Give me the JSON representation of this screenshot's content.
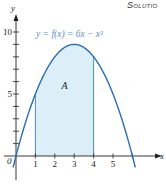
{
  "header": {
    "section_label": "Solutio"
  },
  "chart_data": {
    "type": "area",
    "title": "",
    "function_label": "y = f(x) = 6x − x²",
    "equation": "y = 6x - x^2",
    "xlabel": "x",
    "ylabel": "y",
    "region_label": "A",
    "shaded_interval": [
      1,
      4
    ],
    "xlim": [
      -0.3,
      7.2
    ],
    "ylim": [
      -1.5,
      11.5
    ],
    "x_ticks": [
      1,
      2,
      3,
      4,
      5
    ],
    "x_tick_labels": [
      "1",
      "2",
      "3",
      "4",
      "5"
    ],
    "y_ticks": [
      1,
      2,
      3,
      4,
      5,
      6,
      7,
      8,
      9,
      10
    ],
    "y_tick_labels": {
      "5": "5",
      "10": "10"
    },
    "origin_label": "0",
    "grid": false,
    "curve_domain": [
      -0.15,
      6.15
    ],
    "points": [
      [
        0,
        0
      ],
      [
        1,
        5
      ],
      [
        2,
        8
      ],
      [
        3,
        9
      ],
      [
        4,
        8
      ],
      [
        5,
        5
      ],
      [
        6,
        0
      ]
    ],
    "colors": {
      "curve": "#2a6db5",
      "fill": "#dceef8",
      "axis": "#222222",
      "label": "#5b8fc9"
    }
  }
}
